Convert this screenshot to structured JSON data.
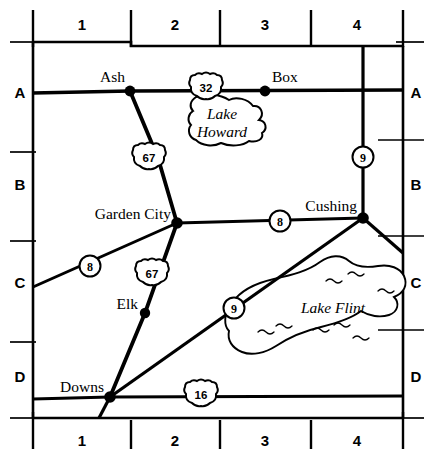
{
  "map": {
    "title": "County road map with grid reference",
    "background_color": "#ffffff",
    "ink_color": "#000000",
    "grid": {
      "column_labels_top": [
        "1",
        "2",
        "3",
        "4"
      ],
      "column_labels_bottom": [
        "1",
        "2",
        "3",
        "4"
      ],
      "row_labels_left": [
        "A",
        "B",
        "C",
        "D"
      ],
      "row_labels_right": [
        "A",
        "B",
        "C",
        "D"
      ]
    },
    "cities": [
      {
        "name": "Ash",
        "grid": "A1"
      },
      {
        "name": "Box",
        "grid": "A3"
      },
      {
        "name": "Garden City",
        "grid": "B2"
      },
      {
        "name": "Cushing",
        "grid": "B4"
      },
      {
        "name": "Elk",
        "grid": "C2"
      },
      {
        "name": "Downs",
        "grid": "D1"
      }
    ],
    "lakes": [
      {
        "name": "Lake Howard",
        "line1": "Lake",
        "line2": "Howard",
        "grid": "A2"
      },
      {
        "name": "Lake Flint",
        "line1": "Lake Flint",
        "grid": "C3"
      }
    ],
    "route_markers": [
      {
        "number": "32",
        "shape": "us-shield",
        "grid": "A2"
      },
      {
        "number": "67",
        "shape": "us-shield",
        "grid": "B2"
      },
      {
        "number": "67",
        "shape": "us-shield",
        "grid": "C2"
      },
      {
        "number": "16",
        "shape": "us-shield",
        "grid": "D2"
      },
      {
        "number": "9",
        "shape": "circle",
        "grid": "B4"
      },
      {
        "number": "9",
        "shape": "circle",
        "grid": "C3"
      },
      {
        "number": "8",
        "shape": "circle",
        "grid": "C1"
      },
      {
        "number": "8",
        "shape": "circle",
        "grid": "B3"
      }
    ]
  }
}
